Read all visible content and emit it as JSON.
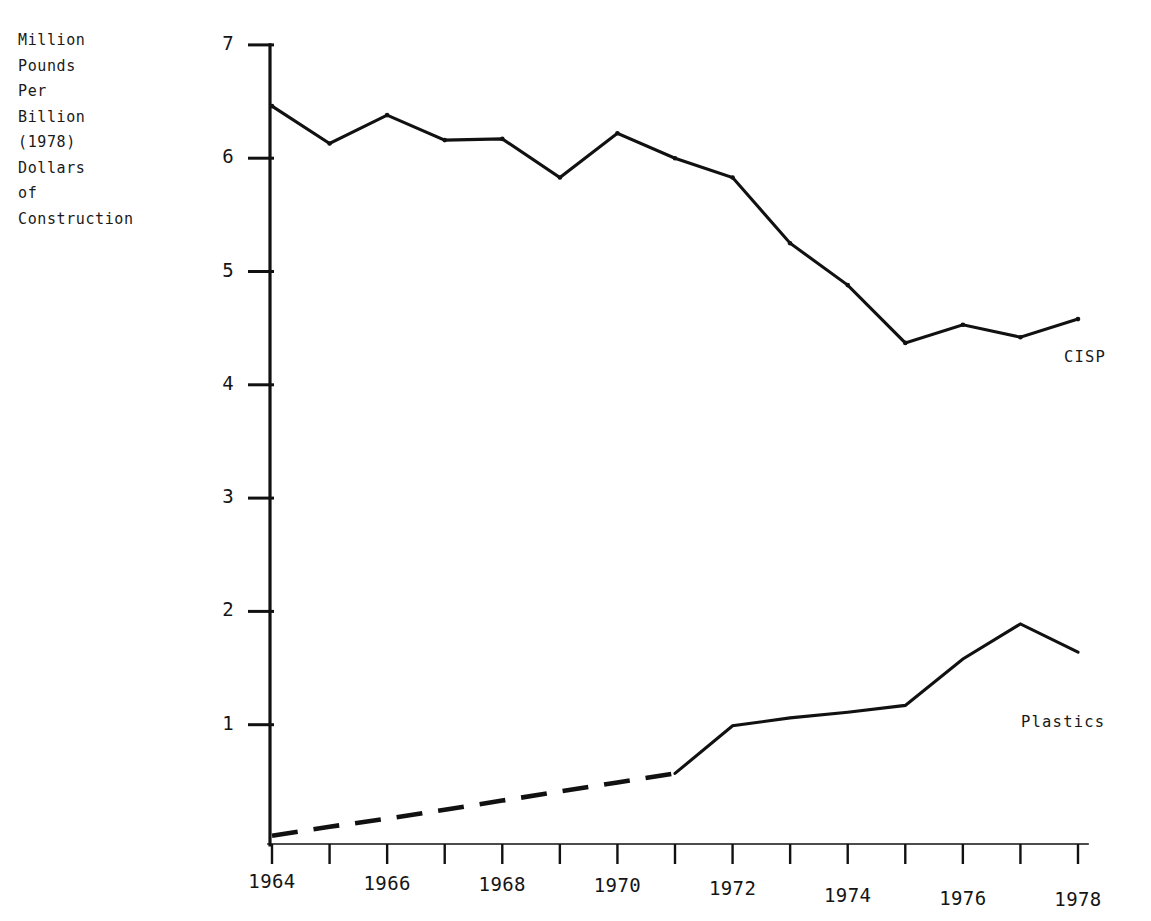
{
  "figure": {
    "background_color": "#ffffff",
    "ink_color": "#111111",
    "y_axis_caption_lines": [
      "Million",
      "Pounds",
      "Per",
      "Billion",
      "(1978)",
      "Dollars",
      "of",
      "Construction"
    ]
  },
  "chart_data": {
    "type": "line",
    "title": "",
    "xlabel": "",
    "ylabel": "Million Pounds Per Billion (1978) Dollars of Construction",
    "xlim": [
      1964,
      1978
    ],
    "ylim": [
      0,
      7
    ],
    "grid": false,
    "legend": "inline-labels-right",
    "x": [
      1964,
      1965,
      1966,
      1967,
      1968,
      1969,
      1970,
      1971,
      1972,
      1973,
      1974,
      1975,
      1976,
      1977,
      1978
    ],
    "xticks": [
      1964,
      1965,
      1966,
      1967,
      1968,
      1969,
      1970,
      1971,
      1972,
      1973,
      1974,
      1975,
      1976,
      1977,
      1978
    ],
    "xtick_labels": [
      "1964",
      "",
      "1966",
      "",
      "1968",
      "",
      "1970",
      "",
      "1972",
      "",
      "1974",
      "",
      "1976",
      "",
      "1978"
    ],
    "yticks": [
      1,
      2,
      3,
      4,
      5,
      6,
      7
    ],
    "ytick_labels": [
      "1",
      "2",
      "3",
      "4",
      "5",
      "6",
      "7"
    ],
    "series": [
      {
        "name": "CISP",
        "label": "CISP",
        "linestyle": "solid",
        "color": "#111111",
        "values": [
          6.46,
          6.13,
          6.38,
          6.16,
          6.17,
          5.83,
          6.22,
          6.0,
          5.83,
          5.25,
          4.88,
          4.37,
          4.53,
          4.42,
          4.58
        ]
      },
      {
        "name": "Plastics",
        "label": "Plastics",
        "linestyle": "dashed-then-solid",
        "dashed_range": [
          1964,
          1971
        ],
        "color": "#111111",
        "values": [
          0.02,
          0.1,
          0.17,
          0.25,
          0.33,
          0.41,
          0.49,
          0.57,
          0.99,
          1.06,
          1.11,
          1.17,
          1.58,
          1.89,
          1.64
        ]
      }
    ]
  }
}
